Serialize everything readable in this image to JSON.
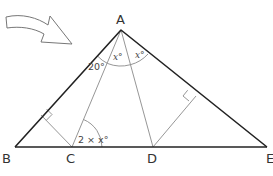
{
  "figure": {
    "type": "geometry-triangle",
    "colors": {
      "main_stroke": "#222222",
      "aux_stroke": "#8a8a8a",
      "text": "#333333",
      "background": "#ffffff"
    },
    "vertices": {
      "A": {
        "label": "A",
        "x": 121,
        "y": 30
      },
      "B": {
        "label": "B",
        "x": 15,
        "y": 147
      },
      "C": {
        "label": "C",
        "x": 72,
        "y": 147
      },
      "D": {
        "label": "D",
        "x": 153,
        "y": 147
      },
      "E": {
        "label": "E",
        "x": 267,
        "y": 147
      }
    },
    "angles": {
      "angle_BAC": "20°",
      "angle_CAD": "x°",
      "angle_DAE": "x°",
      "angle_ACD": "2 × x°"
    },
    "right_angle_markers": 2,
    "arrow": {
      "direction": "pointing toward vertex A",
      "style": "outlined curved arrow"
    }
  }
}
